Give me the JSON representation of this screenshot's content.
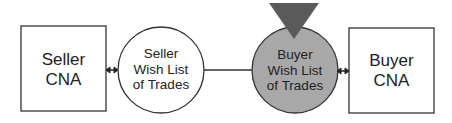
{
  "diagram": {
    "seller_cna": {
      "label_line1": "Seller",
      "label_line2": "CNA"
    },
    "seller_wishlist": {
      "label_line1": "Seller",
      "label_line2": "Wish List",
      "label_line3": "of Trades",
      "fill": "#ffffff"
    },
    "buyer_wishlist": {
      "label_line1": "Buyer",
      "label_line2": "Wish List",
      "label_line3": "of Trades",
      "fill": "#a8a8a8"
    },
    "buyer_cna": {
      "label_line1": "Buyer",
      "label_line2": "CNA"
    },
    "marker": {
      "shape": "downward-triangle",
      "fill": "#5a5a5a"
    },
    "connectors": [
      {
        "from": "seller_cna",
        "to": "seller_wishlist",
        "type": "double-arrow"
      },
      {
        "from": "seller_wishlist",
        "to": "buyer_wishlist",
        "type": "line"
      },
      {
        "from": "buyer_wishlist",
        "to": "buyer_cna",
        "type": "double-arrow"
      }
    ]
  }
}
